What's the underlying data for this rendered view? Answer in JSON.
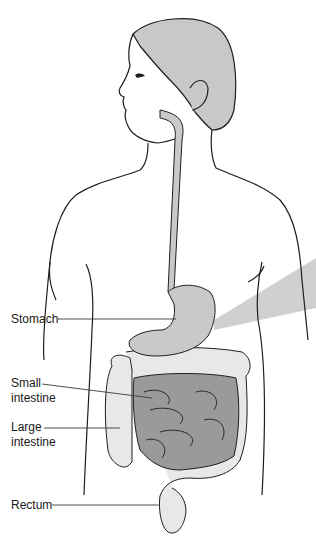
{
  "figure": {
    "colors": {
      "outline": "#1e1e1e",
      "hair": "#c8c8c8",
      "esophagus_stomach": "#c9c9c9",
      "small_intestine": "#9a9a9a",
      "large_intestine": "#e8e8e8",
      "callout_wedge": "#d0d0d0",
      "leader_line": "#3a3a3a"
    },
    "labels": [
      {
        "id": "stomach",
        "text": "Stomach"
      },
      {
        "id": "small_intestine",
        "line1": "Small",
        "line2": "intestine"
      },
      {
        "id": "large_intestine",
        "line1": "Large",
        "line2": "intestine"
      },
      {
        "id": "rectum",
        "text": "Rectum"
      }
    ]
  }
}
